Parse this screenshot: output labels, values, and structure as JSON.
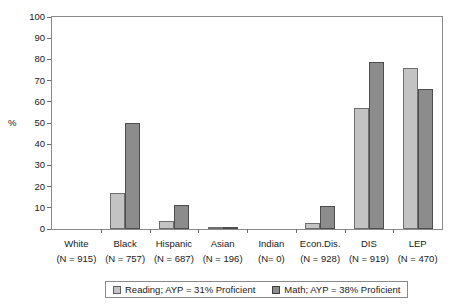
{
  "chart_data": {
    "type": "bar",
    "title": "",
    "xlabel": "",
    "ylabel": "%",
    "ylim": [
      0,
      100
    ],
    "ytick_step": 10,
    "yticks": [
      100,
      90,
      80,
      70,
      60,
      50,
      40,
      30,
      20,
      10,
      0
    ],
    "grid": false,
    "legend_position": "bottom",
    "categories": [
      "White",
      "Black",
      "Hispanic",
      "Asian",
      "Indian",
      "Econ.Dis.",
      "DIS",
      "LEP"
    ],
    "category_sublabels": [
      "(N = 915)",
      "(N = 757)",
      "(N = 687)",
      "(N = 196)",
      "(N= 0)",
      "(N = 928)",
      "(N = 919)",
      "(N = 470)"
    ],
    "series": [
      {
        "name": "Reading; AYP = 31% Proficient",
        "color": "#c3c3c3",
        "values": [
          0,
          17,
          4,
          1,
          0,
          3,
          57,
          76
        ]
      },
      {
        "name": "Math; AYP = 38% Proficient",
        "color": "#8c8c8c",
        "values": [
          0,
          50,
          11.5,
          1,
          0,
          11,
          79,
          66
        ]
      }
    ]
  },
  "legend": {
    "items": [
      {
        "label": "Reading; AYP = 31% Proficient",
        "swatch": "reading"
      },
      {
        "label": "Math; AYP = 38% Proficient",
        "swatch": "math"
      }
    ]
  },
  "axis": {
    "y_title": "%"
  },
  "colors": {
    "reading": "#c3c3c3",
    "math": "#8c8c8c",
    "frame": "#8a8a8a",
    "text": "#1a1a1a"
  }
}
